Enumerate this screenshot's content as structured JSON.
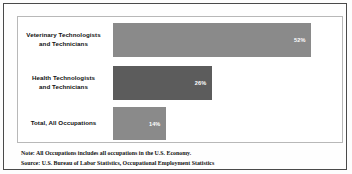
{
  "chart_data": {
    "type": "bar",
    "orientation": "horizontal",
    "title": "",
    "xlabel": "",
    "ylabel": "",
    "xlim": [
      0,
      60
    ],
    "grid": false,
    "legend": "none",
    "categories": [
      "Veterinary Technologists and Technicians",
      "Health Technologists and Technicians",
      "Total, All Occupations"
    ],
    "values": [
      52,
      26,
      14
    ],
    "value_labels": [
      "52%",
      "26%",
      "14%"
    ],
    "bar_colors": [
      "#8a8a8a",
      "#5c5c5c",
      "#8a8a8a"
    ],
    "value_label_color": "#ffffff",
    "bars": [
      {
        "category_line_1": "Veterinary Technologists",
        "category_line_2": "and Technicians",
        "value": 52,
        "label": "52%",
        "color": "#8a8a8a"
      },
      {
        "category_line_1": "Health Technologists",
        "category_line_2": "and Technicians",
        "value": 26,
        "label": "26%",
        "color": "#5c5c5c"
      },
      {
        "category_line_1": "Total, All Occupations",
        "category_line_2": "",
        "value": 14,
        "label": "14%",
        "color": "#8a8a8a"
      }
    ],
    "annotations": [
      "Note: All Occupations includes all occupations in the U.S. Economy.",
      "Source: U.S. Bureau of Labor Statistics, Occupational Employment Statistics"
    ]
  },
  "footnotes": {
    "note": "Note: All Occupations includes all occupations in the U.S. Economy.",
    "source": "Source: U.S. Bureau of Labor Statistics, Occupational Employment Statistics"
  },
  "colors": {
    "outer_border": "#4a4a4a",
    "plot_border": "#b8b8b8",
    "background": "#ffffff",
    "bar_light": "#8a8a8a",
    "bar_dark": "#5c5c5c",
    "text": "#111111"
  }
}
